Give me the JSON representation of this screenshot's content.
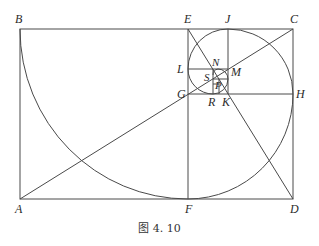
{
  "figure": {
    "caption": "图 4. 10",
    "stroke_color": "#4a4a4a",
    "label_color": "#2b2b2b"
  },
  "points": {
    "A": {
      "label": "A",
      "x": 20,
      "y": 199
    },
    "B": {
      "label": "B",
      "x": 20,
      "y": 29
    },
    "C": {
      "label": "C",
      "x": 293,
      "y": 29
    },
    "D": {
      "label": "D",
      "x": 293,
      "y": 199
    },
    "E": {
      "label": "E",
      "x": 188,
      "y": 29
    },
    "F": {
      "label": "F",
      "x": 188,
      "y": 199
    },
    "G": {
      "label": "G",
      "x": 188,
      "y": 94
    },
    "H": {
      "label": "H",
      "x": 293,
      "y": 94
    },
    "J": {
      "label": "J",
      "x": 228,
      "y": 29
    },
    "K": {
      "label": "K",
      "x": 228,
      "y": 94
    },
    "L": {
      "label": "L",
      "x": 188,
      "y": 69
    },
    "M": {
      "label": "M",
      "x": 228,
      "y": 69
    },
    "N": {
      "label": "N",
      "x": 213,
      "y": 69
    },
    "R": {
      "label": "R",
      "x": 213,
      "y": 94
    },
    "S": {
      "label": "S",
      "x": 213,
      "y": 79
    },
    "P": {
      "label": "P",
      "x": 219,
      "y": 84
    }
  },
  "segments": [
    "AB",
    "BC",
    "CD",
    "DA",
    "EF",
    "GH",
    "JK",
    "LM",
    "NR",
    "AC",
    "ED"
  ],
  "arcs": [
    "B→F centered E",
    "F→H centered G",
    "H→J centered K",
    "J→L centered M",
    "L→R centered N"
  ]
}
